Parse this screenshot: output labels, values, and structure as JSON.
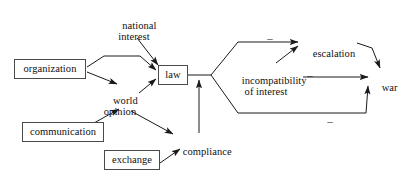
{
  "diagram": {
    "background_color": "#ffffff",
    "line_color": "#1a1a1a",
    "box_border_color": "#4a4a4a",
    "text_color": "#111111",
    "nodes": [
      {
        "id": "organization",
        "label": "organization",
        "style": "boxed",
        "x": 14,
        "y": 59,
        "w": 72,
        "h": 20
      },
      {
        "id": "national_interest",
        "label": "national\ninterest",
        "style": "plain",
        "x": 106,
        "y": 8,
        "w": 56,
        "h": 26
      },
      {
        "id": "law",
        "label": "law",
        "style": "boxed",
        "x": 158,
        "y": 65,
        "w": 30,
        "h": 20
      },
      {
        "id": "world_opinion",
        "label": "world\nopinion",
        "style": "plain",
        "x": 94,
        "y": 83,
        "w": 52,
        "h": 26
      },
      {
        "id": "communication",
        "label": "communication",
        "style": "boxed",
        "x": 22,
        "y": 122,
        "w": 82,
        "h": 20
      },
      {
        "id": "exchange",
        "label": "exchange",
        "style": "boxed",
        "x": 104,
        "y": 150,
        "w": 56,
        "h": 20
      },
      {
        "id": "compliance",
        "label": "compliance",
        "style": "plain",
        "x": 172,
        "y": 134,
        "w": 58,
        "h": 14
      },
      {
        "id": "incompatibility",
        "label": "incompatibility\nof interest",
        "style": "plain",
        "x": 231,
        "y": 63,
        "w": 70,
        "h": 26
      },
      {
        "id": "escalation",
        "label": "escalation",
        "style": "plain",
        "x": 302,
        "y": 36,
        "w": 52,
        "h": 14
      },
      {
        "id": "war",
        "label": "war",
        "style": "plain",
        "x": 371,
        "y": 70,
        "w": 24,
        "h": 14
      }
    ],
    "edge_signs": [
      {
        "id": "sign-escalation",
        "label": "–",
        "x": 265,
        "y": 35
      },
      {
        "id": "sign-incompatibility",
        "label": "–",
        "x": 305,
        "y": 72
      },
      {
        "id": "sign-bottom",
        "label": "–",
        "x": 325,
        "y": 118
      }
    ],
    "edges": [
      {
        "id": "organization-to-law",
        "from": "organization",
        "to": "law"
      },
      {
        "id": "organization-to-world-opinion",
        "from": "organization",
        "to": "world_opinion"
      },
      {
        "id": "national-interest-to-law",
        "from": "national_interest",
        "to": "law"
      },
      {
        "id": "world-opinion-to-law",
        "from": "world_opinion",
        "to": "law"
      },
      {
        "id": "communication-to-world-opinion",
        "from": "communication",
        "to": "world_opinion"
      },
      {
        "id": "world-opinion-to-compliance",
        "from": "world_opinion",
        "to": "compliance"
      },
      {
        "id": "exchange-to-compliance",
        "from": "exchange",
        "to": "compliance"
      },
      {
        "id": "compliance-to-law",
        "from": "compliance",
        "to": "law"
      },
      {
        "id": "law-to-escalation",
        "from": "law",
        "to": "escalation",
        "sign": "–"
      },
      {
        "id": "law-to-war",
        "from": "law",
        "to": "war",
        "sign": "–"
      },
      {
        "id": "incompatibility-to-escalation",
        "from": "incompatibility",
        "to": "escalation"
      },
      {
        "id": "incompatibility-to-war",
        "from": "incompatibility",
        "to": "war",
        "sign": "–"
      },
      {
        "id": "escalation-to-war",
        "from": "escalation",
        "to": "war"
      }
    ]
  }
}
